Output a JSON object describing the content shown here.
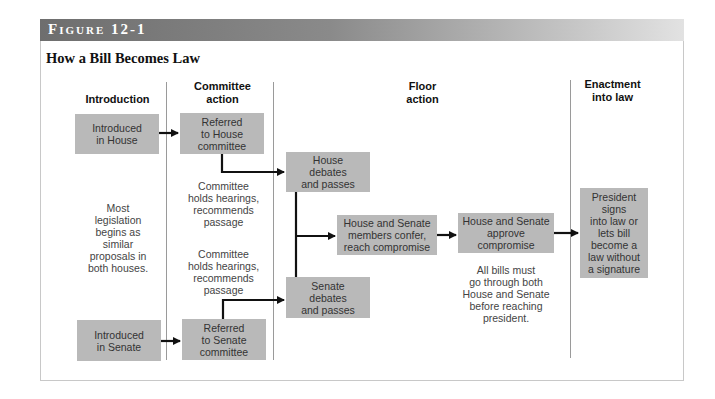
{
  "figure": {
    "label": "Figure 12-1",
    "title": "How a Bill Becomes Law"
  },
  "columns": [
    {
      "id": "introduction",
      "label": "Introduction"
    },
    {
      "id": "committee",
      "label": "Committee\naction"
    },
    {
      "id": "floor",
      "label": "Floor\naction"
    },
    {
      "id": "enactment",
      "label": "Enactment\ninto law"
    }
  ],
  "boxes": {
    "introduced_house": "Introduced\nin House",
    "referred_house": "Referred\nto House\ncommittee",
    "house_debates": "House\ndebates\nand passes",
    "conference": "House and Senate\nmembers confer,\nreach compromise",
    "approve": "House and Senate\napprove\ncompromise",
    "senate_debates": "Senate\ndebates\nand passes",
    "introduced_senate": "Introduced\nin Senate",
    "referred_senate": "Referred\nto Senate\ncommittee",
    "president": "President\nsigns\ninto law or\nlets bill\nbecome a\nlaw without\na signature"
  },
  "notes": {
    "most_legislation": "Most\nlegislation\nbegins as\nsimilar\nproposals in\nboth houses.",
    "committee_house": "Committee\nholds hearings,\nrecommends\npassage",
    "committee_senate": "Committee\nholds hearings,\nrecommends\npassage",
    "all_bills": "All bills must\ngo through both\nHouse and Senate\nbefore reaching\npresident."
  },
  "colors": {
    "box_fill": "#b9b9b9",
    "arrow": "#111111",
    "divider": "#9a9a9a",
    "header_band_dark": "#6e6e6e",
    "header_band_light": "#e2e2e2"
  }
}
